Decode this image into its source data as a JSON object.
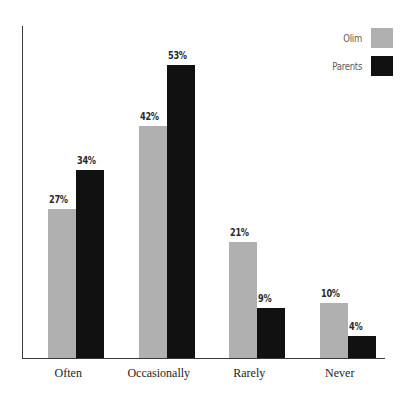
{
  "chart_data": {
    "type": "bar",
    "title": "",
    "subtitle": "",
    "xlabel": "",
    "ylabel": "",
    "grid": false,
    "legend_position": "top-right",
    "value_suffix": "%",
    "ylim": [
      0,
      60
    ],
    "categories": [
      "Often",
      "Occasionally",
      "Rarely",
      "Never"
    ],
    "series": [
      {
        "name": "Olim",
        "color": "#b0b0b0",
        "values": [
          27,
          42,
          21,
          10
        ],
        "labels": [
          "27%",
          "42%",
          "21%",
          "10%"
        ]
      },
      {
        "name": "Parents",
        "color": "#111111",
        "values": [
          34,
          53,
          9,
          4
        ],
        "labels": [
          "34%",
          "53%",
          "9%",
          "4%"
        ]
      }
    ]
  },
  "axis": {
    "y_line_color": "#3a3a3a",
    "x_line_color": "#3a3a3a"
  },
  "legend": {
    "items": [
      {
        "label": "Olim",
        "color": "#b0b0b0"
      },
      {
        "label": "Parents",
        "color": "#111111"
      }
    ]
  }
}
